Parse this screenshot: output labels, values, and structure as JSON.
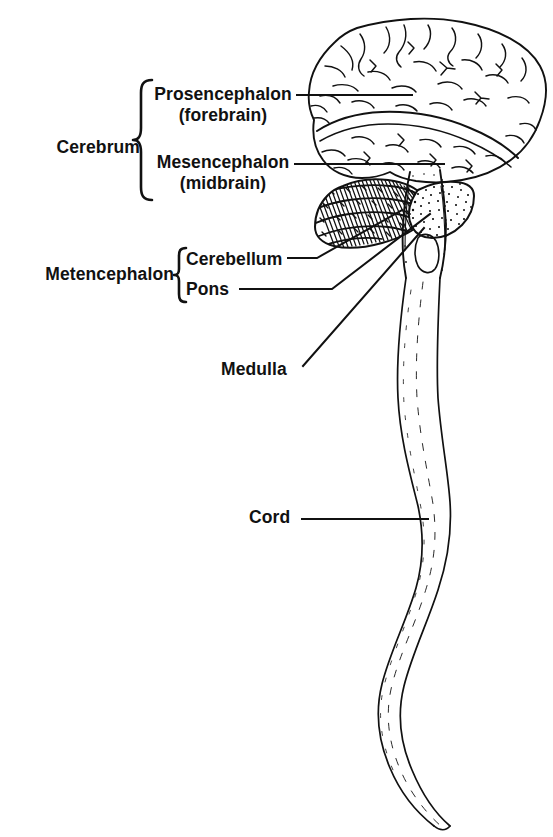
{
  "figure": {
    "type": "anatomical-line-drawing",
    "ink_color": "#111111",
    "background_color": "#ffffff"
  },
  "labels": {
    "cerebrum": "Cerebrum",
    "prosencephalon": "Prosencephalon",
    "prosencephalon_alt": "(forebrain)",
    "mesencephalon": "Mesencephalon",
    "mesencephalon_alt": "(midbrain)",
    "metencephalon": "Metencephalon",
    "cerebellum": "Cerebellum",
    "pons": "Pons",
    "medulla": "Medulla",
    "cord": "Cord"
  },
  "structures": [
    {
      "name": "Cerebrum",
      "kind": "group",
      "members": [
        "Prosencephalon (forebrain)",
        "Mesencephalon (midbrain)"
      ],
      "brace": true
    },
    {
      "name": "Metencephalon",
      "kind": "group",
      "members": [
        "Cerebellum",
        "Pons"
      ],
      "brace": true
    },
    {
      "name": "Medulla",
      "kind": "leaf",
      "shading": "outline"
    },
    {
      "name": "Cord",
      "kind": "leaf",
      "shading": "outline"
    },
    {
      "name": "Cerebellum",
      "kind": "leaf",
      "shading": "dense-hatch"
    },
    {
      "name": "Pons",
      "kind": "leaf",
      "shading": "stipple"
    }
  ],
  "leader_lines": [
    {
      "from": "Prosencephalon",
      "to": "cerebrum-upper-lobe",
      "style": "horizontal"
    },
    {
      "from": "Mesencephalon",
      "to": "midbrain-region",
      "style": "horizontal"
    },
    {
      "from": "Cerebellum",
      "to": "cerebellum-body",
      "style": "elbow-diagonal"
    },
    {
      "from": "Pons",
      "to": "pons-body",
      "style": "elbow-diagonal"
    },
    {
      "from": "Medulla",
      "to": "medulla-oblongata",
      "style": "diagonal"
    },
    {
      "from": "Cord",
      "to": "spinal-cord",
      "style": "horizontal"
    }
  ]
}
